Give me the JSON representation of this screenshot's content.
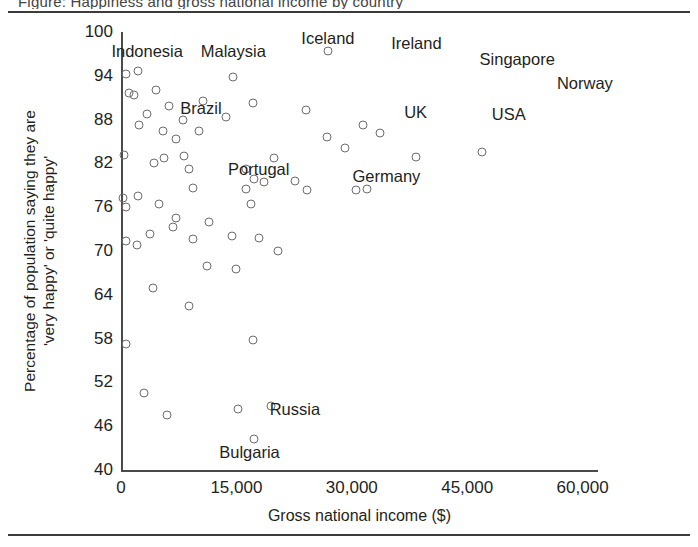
{
  "figure": {
    "clipped_caption_above": "Figure: Happiness and gross national income by country",
    "background_color": "#ffffff",
    "rule_color": "#3b3b3b",
    "point_color": "#6d6d6d",
    "text_color": "#231f20"
  },
  "chart_data": {
    "type": "scatter",
    "title": "",
    "xlabel": "Gross national income ($)",
    "ylabel": "Percentage of population saying they are 'very happy' or 'quite happy'",
    "ylabel_line1": "Percentage of population saying they are",
    "ylabel_line2": "'very happy' or 'quite happy'",
    "xlim": [
      0,
      62000
    ],
    "ylim": [
      40,
      100
    ],
    "xticks": [
      0,
      15000,
      30000,
      45000,
      60000
    ],
    "xtick_labels": [
      "0",
      "15,000",
      "30,000",
      "45,000",
      "60,000"
    ],
    "yticks": [
      40,
      46,
      52,
      58,
      64,
      70,
      76,
      82,
      88,
      94,
      100
    ],
    "ytick_labels": [
      "40",
      "46",
      "52",
      "58",
      "64",
      "70",
      "76",
      "82",
      "88",
      "94",
      "100"
    ],
    "grid": false,
    "legend": "none",
    "marker": "open-circle",
    "points": [
      {
        "x": 600,
        "y": 94.3
      },
      {
        "x": 2200,
        "y": 94.6
      },
      {
        "x": 1000,
        "y": 91.6
      },
      {
        "x": 1700,
        "y": 91.4
      },
      {
        "x": 4600,
        "y": 92.1
      },
      {
        "x": 3400,
        "y": 88.8
      },
      {
        "x": 6200,
        "y": 89.8
      },
      {
        "x": 2300,
        "y": 87.2
      },
      {
        "x": 5500,
        "y": 86.4
      },
      {
        "x": 8100,
        "y": 87.9
      },
      {
        "x": 7100,
        "y": 85.3
      },
      {
        "x": 10200,
        "y": 86.5
      },
      {
        "x": 10700,
        "y": 90.6
      },
      {
        "x": 14600,
        "y": 93.9
      },
      {
        "x": 17100,
        "y": 90.3
      },
      {
        "x": 13700,
        "y": 88.4
      },
      {
        "x": 400,
        "y": 83.2
      },
      {
        "x": 4300,
        "y": 82.0
      },
      {
        "x": 5600,
        "y": 82.7
      },
      {
        "x": 8200,
        "y": 83.0
      },
      {
        "x": 8800,
        "y": 81.3
      },
      {
        "x": 16200,
        "y": 81.3
      },
      {
        "x": 19900,
        "y": 82.8
      },
      {
        "x": 24100,
        "y": 89.3
      },
      {
        "x": 26900,
        "y": 97.4
      },
      {
        "x": 31400,
        "y": 87.3
      },
      {
        "x": 29100,
        "y": 84.1
      },
      {
        "x": 26800,
        "y": 85.6
      },
      {
        "x": 33600,
        "y": 86.1
      },
      {
        "x": 300,
        "y": 77.3
      },
      {
        "x": 700,
        "y": 76.0
      },
      {
        "x": 2200,
        "y": 77.5
      },
      {
        "x": 5000,
        "y": 76.4
      },
      {
        "x": 9300,
        "y": 78.6
      },
      {
        "x": 7200,
        "y": 74.5
      },
      {
        "x": 11400,
        "y": 74.0
      },
      {
        "x": 17300,
        "y": 79.8
      },
      {
        "x": 18600,
        "y": 79.5
      },
      {
        "x": 16300,
        "y": 78.5
      },
      {
        "x": 16900,
        "y": 76.4
      },
      {
        "x": 22600,
        "y": 79.6
      },
      {
        "x": 24200,
        "y": 78.3
      },
      {
        "x": 30600,
        "y": 78.3
      },
      {
        "x": 32000,
        "y": 78.5
      },
      {
        "x": 38400,
        "y": 82.9
      },
      {
        "x": 46900,
        "y": 83.5
      },
      {
        "x": 600,
        "y": 71.4
      },
      {
        "x": 2100,
        "y": 70.8
      },
      {
        "x": 3800,
        "y": 72.3
      },
      {
        "x": 6700,
        "y": 73.3
      },
      {
        "x": 9400,
        "y": 71.6
      },
      {
        "x": 14400,
        "y": 72.0
      },
      {
        "x": 17900,
        "y": 71.8
      },
      {
        "x": 20400,
        "y": 70.0
      },
      {
        "x": 11200,
        "y": 68.0
      },
      {
        "x": 14900,
        "y": 67.5
      },
      {
        "x": 4200,
        "y": 65.0
      },
      {
        "x": 8900,
        "y": 62.5
      },
      {
        "x": 600,
        "y": 57.3
      },
      {
        "x": 17200,
        "y": 57.8
      },
      {
        "x": 3000,
        "y": 50.6
      },
      {
        "x": 6000,
        "y": 47.6
      },
      {
        "x": 15200,
        "y": 48.4
      },
      {
        "x": 19500,
        "y": 48.8
      },
      {
        "x": 17300,
        "y": 44.3
      }
    ],
    "annotations": [
      {
        "label": "Indonesia",
        "x": 3400,
        "y": 97.4
      },
      {
        "label": "Malaysia",
        "x": 14600,
        "y": 97.4
      },
      {
        "label": "Iceland",
        "x": 26900,
        "y": 99.2
      },
      {
        "label": "Ireland",
        "x": 38400,
        "y": 98.5
      },
      {
        "label": "Singapore",
        "x": 51500,
        "y": 96.3
      },
      {
        "label": "Norway",
        "x": 60300,
        "y": 93.0
      },
      {
        "label": "Brazil",
        "x": 10400,
        "y": 89.6
      },
      {
        "label": "UK",
        "x": 38300,
        "y": 89.0
      },
      {
        "label": "USA",
        "x": 50400,
        "y": 88.7
      },
      {
        "label": "Portugal",
        "x": 17900,
        "y": 81.2
      },
      {
        "label": "Germany",
        "x": 34500,
        "y": 80.3
      },
      {
        "label": "Russia",
        "x": 22600,
        "y": 48.4
      },
      {
        "label": "Bulgaria",
        "x": 16700,
        "y": 42.5
      }
    ]
  }
}
